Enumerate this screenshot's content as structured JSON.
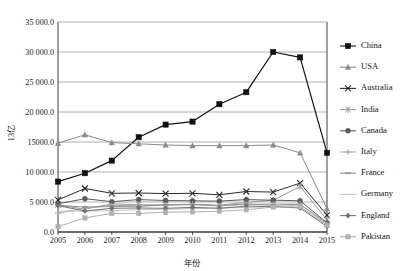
{
  "chart_data": {
    "type": "line",
    "title": "",
    "xlabel": "年份",
    "ylabel": "13亿",
    "categories": [
      "2005",
      "2006",
      "2007",
      "2008",
      "2009",
      "2010",
      "2011",
      "2012",
      "2013",
      "2014",
      "2015"
    ],
    "x": [
      2005,
      2006,
      2007,
      2008,
      2009,
      2010,
      2011,
      2012,
      2013,
      2014,
      2015
    ],
    "ylim": [
      0,
      35000
    ],
    "yticks": [
      0,
      5000,
      10000,
      15000,
      20000,
      25000,
      30000,
      35000
    ],
    "ytick_labels": [
      "0.0",
      "5 000.0",
      "10 000.0",
      "15000.0",
      "20 000.0",
      "25 000.0",
      "30 000.0",
      "35 000.0"
    ],
    "grid": true,
    "legend_position": "right",
    "series": [
      {
        "name": "China",
        "marker": "square",
        "color": "#111111",
        "values": [
          8400,
          9800,
          11900,
          15800,
          17900,
          18400,
          21300,
          23300,
          30000,
          29100,
          13200
        ]
      },
      {
        "name": "USA",
        "marker": "triangle",
        "color": "#8a8a8a",
        "values": [
          14800,
          16200,
          14900,
          14700,
          14500,
          14400,
          14400,
          14400,
          14500,
          13200,
          3900
        ]
      },
      {
        "name": "Australia",
        "marker": "cross",
        "color": "#2b2b2b",
        "values": [
          5350,
          7250,
          6450,
          6500,
          6400,
          6450,
          6200,
          6750,
          6650,
          8150,
          2800
        ]
      },
      {
        "name": "India",
        "marker": "asterisk",
        "color": "#9a9a9a",
        "values": [
          4500,
          3800,
          4700,
          4550,
          4500,
          4650,
          4450,
          4950,
          5300,
          7600,
          2000
        ]
      },
      {
        "name": "Canada",
        "marker": "circle",
        "color": "#5a5a5a",
        "values": [
          4700,
          5550,
          5050,
          5400,
          5250,
          5200,
          5150,
          5400,
          5300,
          5200,
          1550
        ]
      },
      {
        "name": "Italy",
        "marker": "plus",
        "color": "#a8a8a8",
        "values": [
          3150,
          3950,
          4450,
          4350,
          4500,
          4600,
          4350,
          4600,
          4650,
          4650,
          1250
        ]
      },
      {
        "name": "France",
        "marker": "dash",
        "color": "#8f8f8f",
        "values": [
          4450,
          4150,
          4250,
          4300,
          4500,
          4550,
          4400,
          4650,
          4500,
          4600,
          1500
        ]
      },
      {
        "name": "Germany",
        "marker": "none",
        "color": "#c2c2c2",
        "values": [
          3450,
          3500,
          3550,
          3700,
          3800,
          3900,
          4000,
          4100,
          4200,
          4500,
          1300
        ]
      },
      {
        "name": "England",
        "marker": "diamond",
        "color": "#707070",
        "values": [
          4400,
          3500,
          3950,
          4000,
          3950,
          4100,
          3950,
          4300,
          4250,
          4000,
          900
        ]
      },
      {
        "name": "Pakistan",
        "marker": "small-square",
        "color": "#b0b0b0",
        "values": [
          900,
          2350,
          3100,
          3100,
          3300,
          3350,
          3450,
          3700,
          4150,
          4200,
          1100
        ]
      }
    ]
  },
  "legend": {
    "items": [
      {
        "label": "China"
      },
      {
        "label": "USA"
      },
      {
        "label": "Australia"
      },
      {
        "label": "India"
      },
      {
        "label": "Canada"
      },
      {
        "label": "Italy"
      },
      {
        "label": "France"
      },
      {
        "label": "Germany"
      },
      {
        "label": "England"
      },
      {
        "label": "Pakistan"
      }
    ]
  }
}
